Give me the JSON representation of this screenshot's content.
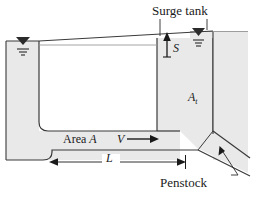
{
  "figure": {
    "name": "surge-tank-penstock-diagram"
  },
  "colors": {
    "fill_gray": "#e9e9e9",
    "outline": "#3a3a3a",
    "text": "#1a1a1a",
    "thin_line": "#6b6b6b"
  },
  "labels": {
    "surge_tank": "Surge tank",
    "penstock": "Penstock",
    "area": "Area",
    "area_symbol": "A",
    "velocity_symbol": "V",
    "surge_height_symbol": "S",
    "tank_area_symbol": "A",
    "tank_area_subscript": "t",
    "length_symbol": "L"
  },
  "annotations": {
    "water_surface_marker_left": "water-level-triangle",
    "water_surface_marker_right": "water-level-triangle",
    "flow_direction": "rightward",
    "surge_direction": "upward",
    "length_dimension": "double-headed-horizontal-arrow"
  }
}
